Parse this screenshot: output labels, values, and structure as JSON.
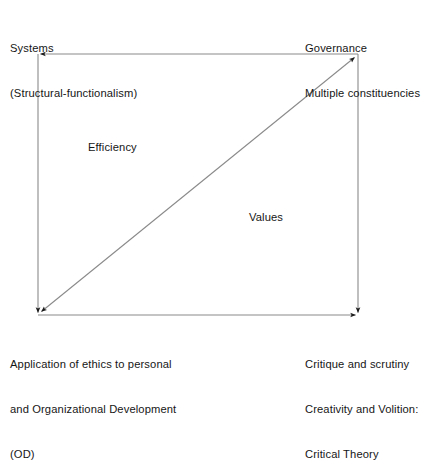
{
  "diagram": {
    "type": "quadrant-arrow-diagram",
    "colors": {
      "line": "#8a8a8a",
      "arrowhead": "#1c1c1c",
      "text": "#161616",
      "background": "#ffffff"
    },
    "box": {
      "left": 38,
      "top": 54,
      "right": 358,
      "bottom": 315
    },
    "corners": {
      "top_left": {
        "lines": [
          "Systems",
          "(Structural-functionalism)"
        ]
      },
      "top_right": {
        "lines": [
          "Governance",
          "Multiple constituencies"
        ]
      },
      "bottom_left": {
        "lines": [
          "Application of ethics to personal",
          "and Organizational Development",
          "(OD)"
        ]
      },
      "bottom_right": {
        "lines": [
          "Critique and scrutiny",
          "Creativity and Volition:",
          "Critical Theory"
        ]
      }
    },
    "interior_labels": {
      "upper_left": "Efficiency",
      "lower_right": "Values"
    },
    "arrows": [
      {
        "name": "top-edge-arrow",
        "from": "top-right",
        "to": "top-left",
        "heads": "end"
      },
      {
        "name": "left-edge-arrow",
        "from": "top-left",
        "to": "bottom-left",
        "heads": "end"
      },
      {
        "name": "right-edge-arrow",
        "from": "top-right",
        "to": "bottom-right",
        "heads": "end"
      },
      {
        "name": "bottom-edge-arrow",
        "from": "bottom-left",
        "to": "bottom-right",
        "heads": "end"
      },
      {
        "name": "diagonal-arrow",
        "from": "bottom-left",
        "to": "top-right",
        "heads": "both"
      }
    ]
  }
}
